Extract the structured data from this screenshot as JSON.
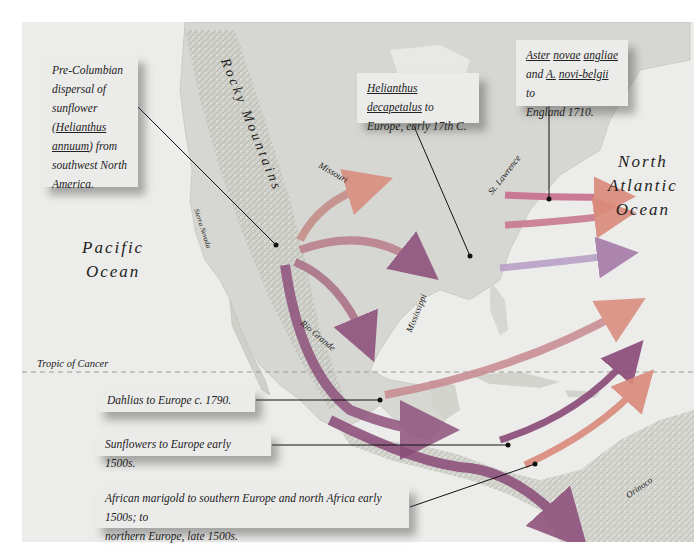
{
  "map": {
    "oceans": {
      "pacific": [
        "Pacific",
        "Ocean"
      ],
      "atlantic": [
        "North",
        "Atlantic",
        "Ocean"
      ]
    },
    "features": {
      "rocky_mountains": "Rocky Mountains",
      "sierra_nevada": "Sierra Nevada",
      "missouri": "Missouri",
      "mississippi": "Mississippi",
      "rio_grande": "Rio Grande",
      "st_lawrence": "St. Lawrence",
      "orinoco": "Orinoco",
      "tropic_of_cancer": "Tropic of Cancer"
    },
    "callouts": {
      "pre_columbian": {
        "line1": "Pre-Columbian",
        "line2": "dispersal of",
        "line3": "sunflower",
        "line4_prefix": "(",
        "line4_u": "Helianthus",
        "line5_u": "annuum",
        "line5_suffix": ") from",
        "line6": "southwest  North",
        "line7": "America."
      },
      "decapetalus": {
        "u1": "Helianthus",
        "u2": "decapetalus",
        "rest1": " to",
        "line2": "Europe, early  17th C."
      },
      "aster": {
        "u1": "Aster",
        "u2": "novae",
        "u3": "angliae",
        "and": "and ",
        "u4": "A.",
        "u5": "novi-belgii",
        "to": " to",
        "line3": "England 1710."
      },
      "dahlias": "Dahlias to Europe c. 1790.",
      "sunflowers": "Sunflowers to Europe early 1500s.",
      "marigold": {
        "line1": "African marigold to southern Europe and north Africa early 1500s; to",
        "line2": "northern Europe, late 1500s."
      }
    },
    "colors": {
      "arrow_salmon": "#d98a7a",
      "arrow_purple": "#8a4a78",
      "arrow_violet": "#a47aa8",
      "land": "#d6d6d2",
      "water": "#ececea"
    }
  }
}
